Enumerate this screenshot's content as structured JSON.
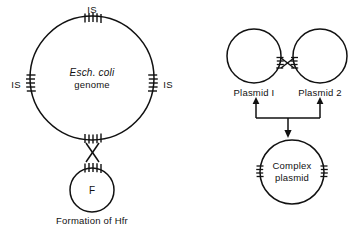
{
  "figure": {
    "title_not_shown": "",
    "background_color": "#ffffff",
    "stroke_color": "#111111",
    "left_panel": {
      "caption": "Formation of Hfr",
      "genome_circle": {
        "label_line1": "Esch. coli",
        "label_line2": "genome",
        "cx": 92,
        "cy": 78,
        "r": 62
      },
      "f_plasmid": {
        "label": "F",
        "cx": 92,
        "cy": 190,
        "r": 22
      },
      "is_labels": [
        {
          "text": "IS",
          "x": 92,
          "y": 12,
          "position": "top"
        },
        {
          "text": "IS",
          "x": 17,
          "y": 85,
          "position": "left"
        },
        {
          "text": "IS",
          "x": 167,
          "y": 85,
          "position": "right"
        }
      ],
      "is_elements_on_genome": [
        {
          "position": "top",
          "cx": 92,
          "cy": 20,
          "orientation": "vertical-ticks"
        },
        {
          "position": "left",
          "cx": 34,
          "cy": 84,
          "orientation": "horizontal-ticks"
        },
        {
          "position": "right",
          "cx": 150,
          "cy": 84,
          "orientation": "horizontal-ticks"
        },
        {
          "position": "bottom",
          "cx": 92,
          "cy": 137,
          "orientation": "vertical-ticks"
        }
      ],
      "crossover": {
        "cx": 92,
        "cy": 152,
        "type": "x-crossover-vertical"
      }
    },
    "right_panel": {
      "plasmid_1": {
        "label": "Plasmid I",
        "cx": 254,
        "cy": 56,
        "r": 27
      },
      "plasmid_2": {
        "label": "Plasmid 2",
        "cx": 320,
        "cy": 56,
        "r": 27
      },
      "crossover": {
        "cx": 287,
        "cy": 63,
        "type": "x-crossover-horizontal"
      },
      "complex_plasmid": {
        "label_line1": "Complex",
        "label_line2": "plasmid",
        "cx": 292,
        "cy": 172,
        "r": 32
      },
      "merge_arrows": {
        "left_arrow_up_x": 256,
        "right_arrow_up_x": 320,
        "brace_y": 117,
        "down_arrow_x": 288,
        "down_arrow_tip_y": 137
      }
    }
  }
}
